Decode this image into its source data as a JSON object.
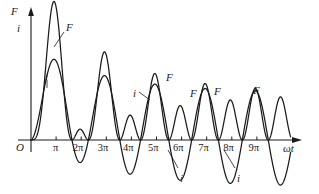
{
  "figure": {
    "title": "",
    "axes": {
      "y_labels": [
        {
          "name": "force-symbol",
          "text": "F"
        },
        {
          "name": "current-symbol",
          "text": "i"
        }
      ],
      "x_axis_label": "ωt",
      "origin_label": "O",
      "x_tick_labels": [
        "π",
        "2π",
        "3π",
        "4π",
        "5π",
        "6π",
        "7π",
        "8π",
        "9π"
      ]
    },
    "curve_labels": [
      {
        "name": "label-F-1",
        "text": "F",
        "x": 66,
        "y": 22,
        "leader": [
          [
            64,
            32
          ],
          [
            54,
            47
          ]
        ]
      },
      {
        "name": "label-i-1",
        "text": "i",
        "x": 45,
        "y": 71,
        "leader": [
          [
            47,
            80
          ],
          [
            47,
            88
          ]
        ]
      },
      {
        "name": "label-i-2",
        "text": "i",
        "x": 133,
        "y": 88,
        "leader": [
          [
            139,
            92
          ],
          [
            150,
            100
          ]
        ]
      },
      {
        "name": "label-F-2",
        "text": "F",
        "x": 166,
        "y": 72,
        "leader": null
      },
      {
        "name": "label-F-3",
        "text": "F",
        "x": 190,
        "y": 88,
        "leader": null
      },
      {
        "name": "label-F-4",
        "text": "F",
        "x": 214,
        "y": 86,
        "leader": null
      },
      {
        "name": "label-F-5",
        "text": "F",
        "x": 253,
        "y": 85,
        "leader": null
      },
      {
        "name": "label-i-3",
        "text": "i",
        "x": 180,
        "y": 173,
        "leader": [
          [
            178,
            168
          ],
          [
            168,
            150
          ]
        ]
      },
      {
        "name": "label-i-4",
        "text": "i",
        "x": 237,
        "y": 173,
        "leader": [
          [
            235,
            168
          ],
          [
            224,
            150
          ]
        ]
      }
    ],
    "colors": {
      "line": "#1a1a1a",
      "axis": "#1a1a1a",
      "background": "#ffffff"
    }
  },
  "chart_data": {
    "type": "line",
    "title": "",
    "xlabel": "ωt",
    "ylabel": "F, i",
    "xlim": [
      -0.6,
      10.6
    ],
    "ylim": [
      -1.05,
      2.35
    ],
    "grid": false,
    "legend": "inline-annotations",
    "x_tick_values": [
      1,
      2,
      3,
      4,
      5,
      6,
      7,
      8,
      9
    ],
    "x_tick_labels": [
      "π",
      "2π",
      "3π",
      "4π",
      "5π",
      "6π",
      "7π",
      "8π",
      "9π"
    ],
    "series": [
      {
        "name": "F",
        "label": "F",
        "model": "force",
        "description": "F proportional to i^2; starts with a large first hump of amplitude ~2.3 at wt~1, decaying through ~1.55, ~1.0, ~0.85 toward a steady double-frequency ripple of ~0.8",
        "peaks": [
          {
            "x": 1.0,
            "y": 2.3
          },
          {
            "x": 2.55,
            "y": 0.28
          },
          {
            "x": 3.1,
            "y": 1.55
          },
          {
            "x": 4.5,
            "y": 0.3
          },
          {
            "x": 5.1,
            "y": 1.05
          },
          {
            "x": 6.1,
            "y": 0.85
          },
          {
            "x": 7.1,
            "y": 0.88
          },
          {
            "x": 8.1,
            "y": 0.8
          },
          {
            "x": 9.1,
            "y": 0.85
          }
        ]
      },
      {
        "name": "i",
        "label": "i",
        "model": "current",
        "description": "i = Im*(sin(wt - phi) + e^{-t/T}*sin(phi)); first positive peak ~1.1, settles to a symmetric sinusoid of amplitude ~0.9 swinging between +0.9 and -0.9",
        "peaks": [
          {
            "x": 1.0,
            "y": 1.1
          },
          {
            "x": 3.1,
            "y": 0.95
          },
          {
            "x": 5.1,
            "y": 0.92
          },
          {
            "x": 7.1,
            "y": 0.9
          },
          {
            "x": 9.1,
            "y": 0.9
          }
        ],
        "troughs": [
          {
            "x": 2.2,
            "y": -0.1
          },
          {
            "x": 4.2,
            "y": -0.45
          },
          {
            "x": 6.15,
            "y": -0.72
          },
          {
            "x": 8.15,
            "y": -0.88
          }
        ]
      }
    ]
  }
}
